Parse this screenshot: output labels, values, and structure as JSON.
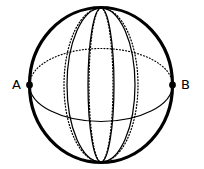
{
  "figure": {
    "name": "sphere-with-meridians-diagram",
    "caption": "",
    "background_color": "#ffffff",
    "stroke_color": "#000000"
  },
  "labels": {
    "point_a": "A",
    "point_b": "B"
  },
  "geometry": {
    "sphere": {
      "center_x": 101,
      "center_y": 85,
      "radius_x": 72,
      "radius_y": 78,
      "outline_width": 3.2,
      "outline_style": "solid"
    },
    "poles": {
      "north_x": 101,
      "north_y": 8,
      "south_x": 101,
      "south_y": 162
    },
    "equator": {
      "center_x": 101,
      "center_y": 85,
      "radius_x": 72,
      "radius_y": 37,
      "front_style": "solid",
      "back_style": "dotted",
      "line_width": 1.1
    },
    "markers": {
      "a_x": 29,
      "a_y": 85,
      "b_x": 173,
      "b_y": 85,
      "radius": 3.4
    },
    "meridians": [
      {
        "id": "meridian-1",
        "half_width": 34,
        "style": "solid",
        "line_width": 1.2
      },
      {
        "id": "meridian-2",
        "half_width": 13,
        "style": "solid",
        "line_width": 1.2
      },
      {
        "id": "meridian-3",
        "half_width": 12,
        "style": "dotted",
        "line_width": 1.2
      },
      {
        "id": "meridian-4",
        "half_width": 37,
        "style": "dotted",
        "line_width": 1.2
      }
    ]
  }
}
